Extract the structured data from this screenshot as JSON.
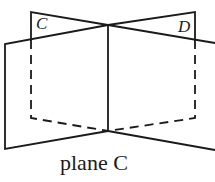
{
  "diagram": {
    "caption": "plane C",
    "labels": {
      "left_plane": "C",
      "right_plane": "D"
    },
    "stroke_color": "#1a1a1a",
    "background": "#ffffff",
    "segments": {
      "solid": [
        [
          [
            5,
            44
          ],
          [
            108,
            25
          ]
        ],
        [
          [
            5,
            44
          ],
          [
            5,
            149
          ]
        ],
        [
          [
            5,
            149
          ],
          [
            108,
            131
          ]
        ],
        [
          [
            31,
            12
          ],
          [
            108,
            25
          ]
        ],
        [
          [
            195,
            12
          ],
          [
            108,
            25
          ]
        ],
        [
          [
            108,
            25
          ],
          [
            215,
            43
          ]
        ],
        [
          [
            108,
            131
          ],
          [
            215,
            150
          ]
        ],
        [
          [
            108,
            25
          ],
          [
            108,
            131
          ]
        ],
        [
          [
            31,
            12
          ],
          [
            31,
            40
          ]
        ],
        [
          [
            195,
            12
          ],
          [
            195,
            40
          ]
        ]
      ],
      "dashed": [
        [
          [
            31,
            40
          ],
          [
            31,
            118
          ]
        ],
        [
          [
            31,
            118
          ],
          [
            108,
            131
          ]
        ],
        [
          [
            195,
            40
          ],
          [
            195,
            118
          ]
        ],
        [
          [
            195,
            118
          ],
          [
            108,
            131
          ]
        ]
      ]
    }
  }
}
